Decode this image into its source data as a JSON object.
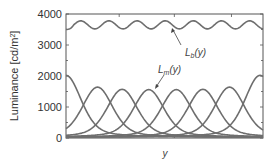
{
  "chart_data": {
    "type": "line",
    "title": "",
    "xlabel": "y",
    "ylabel": "Luminance [cd/m²]",
    "ylim": [
      0,
      4000
    ],
    "yticks": [
      0,
      1000,
      2000,
      3000,
      4000
    ],
    "ytick_labels": [
      "0",
      "1000",
      "2000",
      "3000",
      "4000"
    ],
    "xticks_labeled": false,
    "grid": false,
    "legend": null,
    "series": [
      {
        "name": "L_b(y)",
        "description": "background luminance, oscillating",
        "baseline": 3650,
        "amplitude": 130,
        "periods": 7,
        "start_value": 3500
      },
      {
        "name": "L_m(y)",
        "description": "family of 8 bell-shaped luminance profiles",
        "peaks": [
          {
            "x_frac": 0.0,
            "peak": 2000
          },
          {
            "x_frac": 0.16,
            "peak": 1620
          },
          {
            "x_frac": 0.285,
            "peak": 1550
          },
          {
            "x_frac": 0.42,
            "peak": 1540
          },
          {
            "x_frac": 0.56,
            "peak": 1540
          },
          {
            "x_frac": 0.695,
            "peak": 1550
          },
          {
            "x_frac": 0.83,
            "peak": 1620
          },
          {
            "x_frac": 0.985,
            "peak": 2000
          }
        ]
      }
    ],
    "annotations": [
      {
        "text_main": "L",
        "text_sub": "b",
        "text_tail": "(y)",
        "target": "L_b(y)"
      },
      {
        "text_main": "L",
        "text_sub": "m",
        "text_tail": "(y)",
        "target": "L_m(y)"
      }
    ]
  },
  "labels": {
    "ylabel_main": "Luminance [cd/m",
    "ylabel_sup": "2",
    "ylabel_tail": "]",
    "xlabel": "y",
    "lb_main": "L",
    "lb_sub": "b",
    "lb_tail": "(y)",
    "lm_main": "L",
    "lm_sub": "m",
    "lm_tail": "(y)",
    "y0": "0",
    "y1000": "1000",
    "y2000": "2000",
    "y3000": "3000",
    "y4000": "4000"
  },
  "colors": {
    "curve": "#6e6e6e",
    "axis": "#555555",
    "text": "#333333"
  }
}
